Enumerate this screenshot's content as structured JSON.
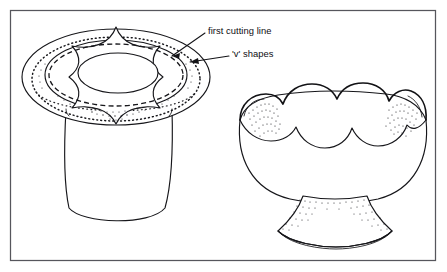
{
  "figure": {
    "background_color": "#ffffff",
    "ink_color": "#16161a",
    "frame_color": "#56565c",
    "frame": {
      "name": "figure-border",
      "x": 10,
      "y": 10,
      "width": 426,
      "height": 251
    },
    "annotations": [
      {
        "id": "first-cutting-line",
        "label": "first cutting line",
        "text_x": 208,
        "text_y": 31,
        "leader_from_x": 205,
        "leader_from_y": 33,
        "leader_to_x": 172,
        "leader_to_y": 56
      },
      {
        "id": "v-shapes",
        "label": "'v' shapes",
        "text_x": 232,
        "text_y": 54,
        "leader_from_x": 229,
        "leader_from_y": 56,
        "leader_to_x": 189,
        "leader_to_y": 62
      }
    ],
    "objects": [
      {
        "id": "marked-pot",
        "name": "flower-pot-with-cutting-guides",
        "description": "Tapered pot seen from above-left with a wide flat rim; rim carries a dotted guide band, a dashed first cutting line, and a star of 'v' shapes around the inner opening.",
        "center_x": 116,
        "center_y": 120,
        "parts": [
          "outer-rim-ellipse",
          "inner-rim-ellipse",
          "dotted-guide-ellipse",
          "dashed-cutting-ellipse",
          "v-shape-star",
          "inner-opening-ellipse",
          "pot-body"
        ]
      },
      {
        "id": "finished-bowl",
        "name": "finished-scalloped-bowl",
        "description": "Completed footed bowl with a scalloped petal rim, stippled shading inside the rim ends and on the pedestal foot.",
        "center_x": 332,
        "center_y": 170,
        "parts": [
          "scalloped-back-rim",
          "scalloped-front-rim",
          "bowl-body",
          "pedestal-foot",
          "stipple-shading"
        ]
      }
    ]
  }
}
